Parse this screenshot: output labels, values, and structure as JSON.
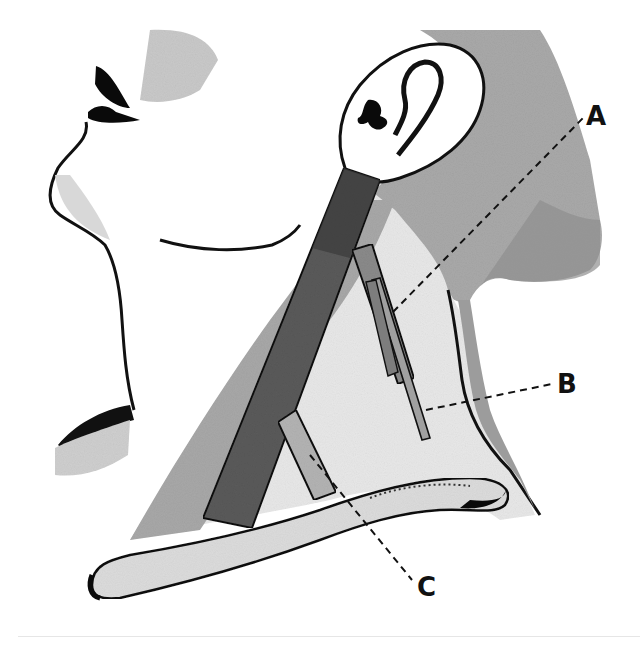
{
  "figure": {
    "labels": [
      {
        "id": "A",
        "text": "A"
      },
      {
        "id": "B",
        "text": "B"
      },
      {
        "id": "C",
        "text": "C"
      }
    ]
  },
  "colors": {
    "background": "#ffffff",
    "skin_light": "#f4f4f4",
    "skin_shade": "#bdbdbd",
    "muscle_dark": "#4a4a4a",
    "muscle_mid": "#7a7a7a",
    "muscle_light": "#a6a6a6",
    "outline": "#111111"
  }
}
